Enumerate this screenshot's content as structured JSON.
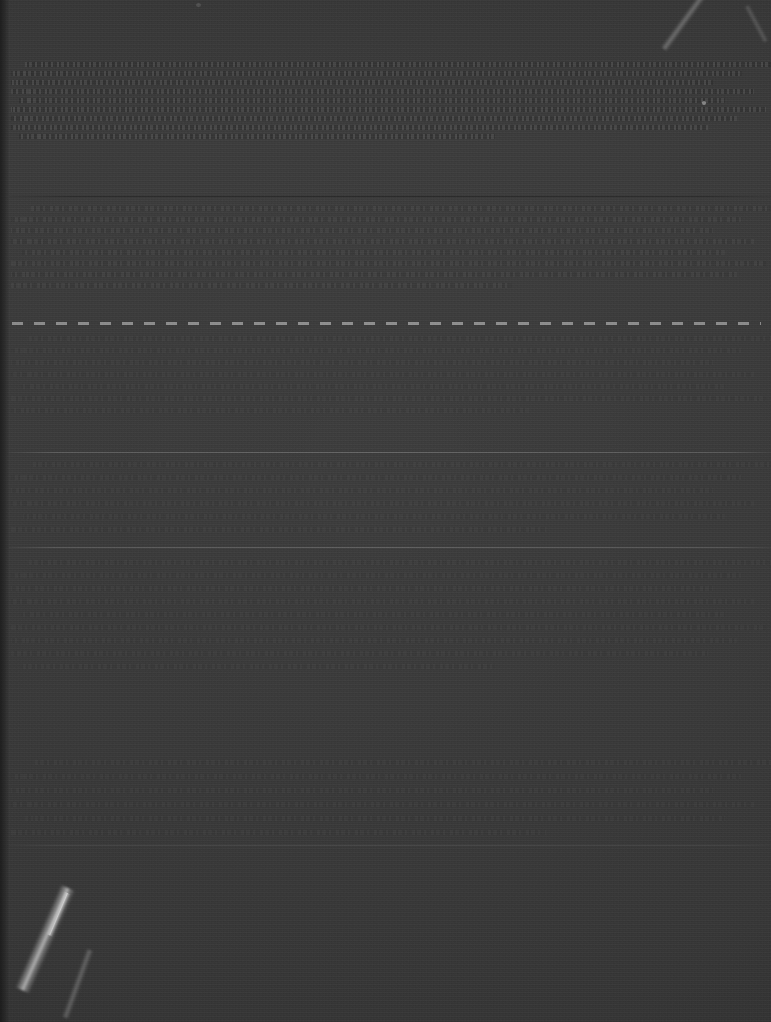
{
  "document": {
    "kind": "scanned-page",
    "legibility": "illegible",
    "width": 771,
    "height": 1022,
    "media_note": "severely underexposed scan; no text recoverable at any zoom level",
    "background_color": "#3c3c3c",
    "ink_tone": "#9a9a9a"
  },
  "page_border": {
    "left_strip_width": 9,
    "color": "#141414"
  },
  "rules": [
    {
      "name": "upper-rule",
      "y": 196,
      "style": "solid",
      "variant": "shadow"
    },
    {
      "name": "dashed-separator",
      "y": 322,
      "style": "dashed",
      "variant": "bright"
    },
    {
      "name": "mid-rule",
      "y": 452,
      "style": "solid",
      "variant": "bright"
    },
    {
      "name": "lower-mid-rule",
      "y": 547,
      "style": "solid",
      "variant": "bright"
    },
    {
      "name": "lower-rule",
      "y": 845,
      "style": "solid",
      "variant": "faint"
    }
  ],
  "text_bands": [
    {
      "name": "band-top",
      "top": 62,
      "lines": 9,
      "line_gap": 9,
      "weight": "dense",
      "indent": 16
    },
    {
      "name": "band-upper-mid",
      "top": 206,
      "lines": 8,
      "line_gap": 11,
      "weight": "normal",
      "indent": 22
    },
    {
      "name": "band-mid",
      "top": 336,
      "lines": 7,
      "line_gap": 12,
      "weight": "faint",
      "indent": 20
    },
    {
      "name": "band-lower-mid",
      "top": 462,
      "lines": 6,
      "line_gap": 13,
      "weight": "faint",
      "indent": 24
    },
    {
      "name": "band-lower",
      "top": 560,
      "lines": 9,
      "line_gap": 13,
      "weight": "faint",
      "indent": 20
    },
    {
      "name": "band-bottom",
      "top": 760,
      "lines": 6,
      "line_gap": 14,
      "weight": "faint",
      "indent": 26
    }
  ],
  "artifacts": [
    {
      "name": "crease-lower-left",
      "type": "fold",
      "x": 60,
      "y": 888,
      "prominence": "high"
    },
    {
      "name": "scratch-upper-right",
      "type": "scratch",
      "x": 700,
      "y": 0,
      "prominence": "medium"
    },
    {
      "name": "scratch-top-right",
      "type": "scratch",
      "x": 744,
      "y": 6,
      "prominence": "low"
    },
    {
      "name": "speck-upper-right",
      "type": "dust",
      "x": 702,
      "y": 101,
      "prominence": "low"
    },
    {
      "name": "speck-top-edge",
      "type": "dust",
      "x": 196,
      "y": 3,
      "prominence": "low"
    }
  ]
}
